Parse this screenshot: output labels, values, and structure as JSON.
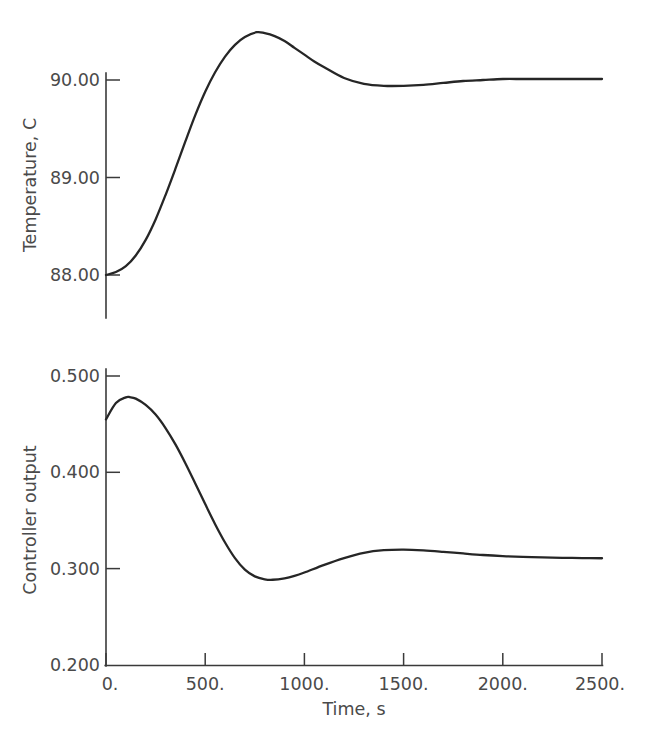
{
  "figure": {
    "background_color": "#ffffff",
    "line_color": "#262626",
    "axis_color": "#3a3a3a",
    "text_color": "#4a4a4a"
  },
  "chart_data": [
    {
      "type": "line",
      "panel": "top",
      "title": "",
      "xlabel": "Time, s",
      "ylabel": "Temperature, C",
      "xlim": [
        0,
        2500
      ],
      "ylim": [
        88.0,
        90.0
      ],
      "xticks": [
        0,
        500,
        1000,
        1500,
        2000,
        2500
      ],
      "xticklabels": [
        "0.",
        "500.",
        "1000.",
        "1500.",
        "2000.",
        "2500."
      ],
      "yticks": [
        88.0,
        89.0,
        90.0
      ],
      "yticklabels": [
        "88.00",
        "89.00",
        "90.00"
      ],
      "grid": false,
      "legend": "none",
      "series": [
        {
          "name": "Temperature",
          "x": [
            0,
            50,
            100,
            150,
            200,
            250,
            300,
            350,
            400,
            450,
            500,
            550,
            600,
            650,
            700,
            760,
            800,
            850,
            900,
            950,
            1000,
            1050,
            1100,
            1200,
            1300,
            1400,
            1500,
            1600,
            1700,
            1800,
            1900,
            2000,
            2100,
            2200,
            2300,
            2400,
            2500
          ],
          "y": [
            88.0,
            88.03,
            88.09,
            88.2,
            88.36,
            88.57,
            88.82,
            89.09,
            89.37,
            89.64,
            89.88,
            90.08,
            90.24,
            90.36,
            90.44,
            90.49,
            90.48,
            90.45,
            90.4,
            90.33,
            90.26,
            90.19,
            90.13,
            90.02,
            89.96,
            89.94,
            89.94,
            89.95,
            89.97,
            89.99,
            90.0,
            90.01,
            90.01,
            90.01,
            90.01,
            90.01,
            90.01
          ]
        }
      ]
    },
    {
      "type": "line",
      "panel": "bottom",
      "title": "",
      "xlabel": "Time, s",
      "ylabel": "Controller output",
      "xlim": [
        0,
        2500
      ],
      "ylim": [
        0.2,
        0.5
      ],
      "xticks": [
        0,
        500,
        1000,
        1500,
        2000,
        2500
      ],
      "xticklabels": [
        "0.",
        "500.",
        "1000.",
        "1500.",
        "2000.",
        "2500."
      ],
      "yticks": [
        0.2,
        0.3,
        0.4,
        0.5
      ],
      "yticklabels": [
        "0.200",
        "0.300",
        "0.400",
        "0.500"
      ],
      "grid": false,
      "legend": "none",
      "series": [
        {
          "name": "Controller output",
          "x": [
            0,
            50,
            100,
            120,
            150,
            200,
            250,
            300,
            350,
            400,
            450,
            500,
            550,
            600,
            650,
            700,
            750,
            800,
            840,
            900,
            950,
            1000,
            1100,
            1200,
            1300,
            1400,
            1500,
            1600,
            1700,
            1800,
            1900,
            2000,
            2100,
            2200,
            2300,
            2400,
            2500
          ],
          "y": [
            0.455,
            0.472,
            0.4778,
            0.478,
            0.4765,
            0.47,
            0.46,
            0.446,
            0.429,
            0.4095,
            0.3885,
            0.367,
            0.3462,
            0.3272,
            0.311,
            0.299,
            0.292,
            0.289,
            0.2885,
            0.29,
            0.2925,
            0.296,
            0.304,
            0.311,
            0.3165,
            0.3192,
            0.3198,
            0.319,
            0.3175,
            0.3158,
            0.3142,
            0.313,
            0.3122,
            0.3117,
            0.3113,
            0.311,
            0.3108
          ]
        }
      ]
    }
  ],
  "axes": {
    "top": {
      "y_title": "Temperature, C",
      "tick_labels": [
        "90.00",
        "89.00",
        "88.00"
      ]
    },
    "bottom": {
      "y_title": "Controller output",
      "tick_labels": [
        "0.500",
        "0.400",
        "0.300",
        "0.200"
      ]
    },
    "x": {
      "title": "Time, s",
      "tick_labels": [
        "0.",
        "500.",
        "1000.",
        "1500.",
        "2000.",
        "2500."
      ]
    }
  }
}
